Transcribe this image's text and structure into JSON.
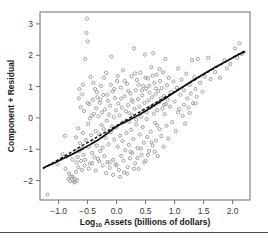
{
  "chart_data": {
    "type": "scatter",
    "title": "",
    "subtitle": "",
    "xlabel": "Log10 Assets (billions of dollars)",
    "xlabel_base": "Log",
    "xlabel_sub": "10",
    "xlabel_rest": " Assets (billions of dollars)",
    "ylabel": "Component + Residual",
    "xlim": [
      -1.32,
      2.3
    ],
    "ylim": [
      -2.62,
      3.38
    ],
    "xticks": [
      -1.0,
      -0.5,
      0.0,
      0.5,
      1.0,
      1.5,
      2.0
    ],
    "xticklabels": [
      "-1.0",
      "-0.5",
      "0.0",
      "0.5",
      "1.0",
      "1.5",
      "2.0"
    ],
    "yticks": [
      -2,
      -1,
      0,
      1,
      2,
      3
    ],
    "yticklabels": [
      "-2",
      "-1",
      "0",
      "1",
      "2",
      "3"
    ],
    "grid": false,
    "legend": "none",
    "marker": "open-circle",
    "marker_color": "#8b8b8b",
    "marker_size": 3.2,
    "frame_color": "#6f6f6f",
    "line_color": "#111111",
    "series": [
      {
        "name": "Component + Residual",
        "points": [
          [
            -1.19,
            -2.45
          ],
          [
            -1.02,
            -1.48
          ],
          [
            -0.93,
            -1.16
          ],
          [
            -0.89,
            -0.57
          ],
          [
            -0.86,
            -1.23
          ],
          [
            -0.83,
            -1.95
          ],
          [
            -0.8,
            -2.02
          ],
          [
            -0.78,
            -1.88
          ],
          [
            -0.76,
            -1.33
          ],
          [
            -0.74,
            -2.03
          ],
          [
            -0.72,
            -1.95
          ],
          [
            -0.71,
            -1.05
          ],
          [
            -0.7,
            -0.62
          ],
          [
            -0.69,
            -1.42
          ],
          [
            -0.68,
            -1.99
          ],
          [
            -0.67,
            -1.25
          ],
          [
            -0.66,
            -0.33
          ],
          [
            -0.65,
            0.62
          ],
          [
            -0.64,
            -1.05
          ],
          [
            -0.63,
            -0.81
          ],
          [
            -0.62,
            0.34
          ],
          [
            -0.61,
            -1.37
          ],
          [
            -0.6,
            -0.98
          ],
          [
            -0.59,
            0.75
          ],
          [
            -0.58,
            -0.48
          ],
          [
            -0.57,
            -1.18
          ],
          [
            -0.56,
            0.22
          ],
          [
            -0.55,
            -1.52
          ],
          [
            -0.54,
            1.88
          ],
          [
            -0.53,
            -0.71
          ],
          [
            -0.52,
            2.71
          ],
          [
            -0.51,
            3.17
          ],
          [
            -0.5,
            2.44
          ],
          [
            -0.49,
            -0.19
          ],
          [
            -0.48,
            -0.92
          ],
          [
            -0.47,
            0.44
          ],
          [
            -0.46,
            -1.46
          ],
          [
            -0.45,
            1.31
          ],
          [
            -0.44,
            -0.55
          ],
          [
            -0.43,
            0.07
          ],
          [
            -0.42,
            -1.12
          ],
          [
            -0.41,
            0.58
          ],
          [
            -0.4,
            -0.77
          ],
          [
            -0.39,
            0.13
          ],
          [
            -0.38,
            -1.26
          ],
          [
            -0.37,
            0.92
          ],
          [
            -0.36,
            -0.42
          ],
          [
            -0.35,
            0.31
          ],
          [
            -0.34,
            -0.88
          ],
          [
            -0.33,
            0.66
          ],
          [
            -0.32,
            -1.31
          ],
          [
            -0.31,
            0.05
          ],
          [
            -0.3,
            -0.52
          ],
          [
            -0.29,
            0.48
          ],
          [
            -0.28,
            -1.06
          ],
          [
            -0.27,
            1.02
          ],
          [
            -0.26,
            -0.23
          ],
          [
            -0.25,
            0.18
          ],
          [
            -0.24,
            -0.95
          ],
          [
            -0.23,
            0.73
          ],
          [
            -0.22,
            -0.36
          ],
          [
            -0.21,
            -1.22
          ],
          [
            -0.2,
            0.27
          ],
          [
            -0.19,
            -0.63
          ],
          [
            -0.18,
            1.44
          ],
          [
            -0.17,
            -0.09
          ],
          [
            -0.16,
            -1.41
          ],
          [
            -0.15,
            0.55
          ],
          [
            -0.14,
            -0.84
          ],
          [
            -0.13,
            0.11
          ],
          [
            -0.12,
            -1.59
          ],
          [
            -0.11,
            0.39
          ],
          [
            -0.1,
            -0.45
          ],
          [
            -0.09,
            1.96
          ],
          [
            -0.08,
            -0.28
          ],
          [
            -0.07,
            0.84
          ],
          [
            -0.06,
            -1.34
          ],
          [
            -0.05,
            0.02
          ],
          [
            -0.04,
            -0.69
          ],
          [
            -0.03,
            0.64
          ],
          [
            -0.02,
            -1.48
          ],
          [
            -0.01,
            0.24
          ],
          [
            0.0,
            -0.31
          ],
          [
            0.01,
            1.18
          ],
          [
            0.02,
            -0.92
          ],
          [
            0.03,
            0.46
          ],
          [
            0.04,
            -1.66
          ],
          [
            0.05,
            0.08
          ],
          [
            0.06,
            -0.57
          ],
          [
            0.07,
            0.97
          ],
          [
            0.08,
            -1.21
          ],
          [
            0.09,
            0.33
          ],
          [
            0.1,
            -0.74
          ],
          [
            0.11,
            1.52
          ],
          [
            0.12,
            -0.14
          ],
          [
            0.13,
            -1.74
          ],
          [
            0.14,
            0.69
          ],
          [
            0.15,
            -1.03
          ],
          [
            0.16,
            0.21
          ],
          [
            0.17,
            -0.48
          ],
          [
            0.18,
            1.09
          ],
          [
            0.19,
            -1.57
          ],
          [
            0.2,
            0.41
          ],
          [
            0.21,
            -0.86
          ],
          [
            0.22,
            0.15
          ],
          [
            0.23,
            -1.29
          ],
          [
            0.24,
            0.78
          ],
          [
            0.25,
            -0.38
          ],
          [
            0.26,
            1.33
          ],
          [
            0.27,
            -1.12
          ],
          [
            0.28,
            0.52
          ],
          [
            0.29,
            -0.67
          ],
          [
            0.3,
            2.22
          ],
          [
            0.31,
            0.29
          ],
          [
            0.32,
            -1.45
          ],
          [
            0.33,
            0.88
          ],
          [
            0.34,
            -0.21
          ],
          [
            0.35,
            1.21
          ],
          [
            0.36,
            -0.96
          ],
          [
            0.37,
            0.6
          ],
          [
            0.38,
            -1.63
          ],
          [
            0.39,
            0.36
          ],
          [
            0.4,
            -0.53
          ],
          [
            0.41,
            1.44
          ],
          [
            0.42,
            0.04
          ],
          [
            0.43,
            -1.18
          ],
          [
            0.44,
            0.72
          ],
          [
            0.45,
            -0.29
          ],
          [
            0.46,
            1.02
          ],
          [
            0.47,
            -0.79
          ],
          [
            0.48,
            0.48
          ],
          [
            0.49,
            2.02
          ],
          [
            0.5,
            -1.36
          ],
          [
            0.51,
            0.93
          ],
          [
            0.52,
            0.18
          ],
          [
            0.53,
            -0.61
          ],
          [
            0.54,
            1.26
          ],
          [
            0.55,
            0.56
          ],
          [
            0.56,
            -1.05
          ],
          [
            0.57,
            0.81
          ],
          [
            0.58,
            0.33
          ],
          [
            0.59,
            -0.44
          ],
          [
            0.6,
            1.62
          ],
          [
            0.61,
            0.66
          ],
          [
            0.62,
            -0.88
          ],
          [
            0.63,
            2.06
          ],
          [
            0.64,
            0.41
          ],
          [
            0.65,
            1.12
          ],
          [
            0.66,
            -0.16
          ],
          [
            0.67,
            0.75
          ],
          [
            0.68,
            -0.72
          ],
          [
            0.69,
            1.38
          ],
          [
            0.7,
            0.25
          ],
          [
            0.71,
            -1.22
          ],
          [
            0.72,
            0.86
          ],
          [
            0.73,
            0.5
          ],
          [
            0.74,
            -0.36
          ],
          [
            0.75,
            1.18
          ],
          [
            0.76,
            0.62
          ],
          [
            0.77,
            -0.58
          ],
          [
            0.78,
            0.95
          ],
          [
            0.79,
            0.3
          ],
          [
            0.8,
            1.46
          ],
          [
            0.81,
            -0.92
          ],
          [
            0.82,
            0.7
          ],
          [
            0.83,
            0.12
          ],
          [
            0.84,
            1.88
          ],
          [
            0.85,
            0.44
          ],
          [
            0.86,
            -0.25
          ],
          [
            0.87,
            1.04
          ],
          [
            0.88,
            0.58
          ],
          [
            0.89,
            -0.66
          ],
          [
            0.9,
            1.28
          ],
          [
            0.92,
            0.36
          ],
          [
            0.94,
            0.82
          ],
          [
            0.96,
            -0.13
          ],
          [
            0.98,
            1.16
          ],
          [
            1.0,
            0.52
          ],
          [
            1.02,
            -0.42
          ],
          [
            1.04,
            0.96
          ],
          [
            1.06,
            1.58
          ],
          [
            1.08,
            0.28
          ],
          [
            1.1,
            0.74
          ],
          [
            1.12,
            1.22
          ],
          [
            1.14,
            0.07
          ],
          [
            1.16,
            0.88
          ],
          [
            1.18,
            -0.18
          ],
          [
            1.2,
            1.41
          ],
          [
            1.22,
            0.62
          ],
          [
            1.24,
            0.33
          ],
          [
            1.26,
            1.05
          ],
          [
            1.28,
            0.78
          ],
          [
            1.3,
            1.84
          ],
          [
            1.32,
            0.47
          ],
          [
            1.34,
            1.3
          ],
          [
            1.36,
            0.92
          ],
          [
            1.38,
            0.68
          ],
          [
            1.4,
            1.88
          ],
          [
            1.44,
            1.12
          ],
          [
            1.48,
            0.84
          ],
          [
            1.52,
            1.32
          ],
          [
            1.58,
            1.92
          ],
          [
            1.62,
            1.24
          ],
          [
            1.7,
            1.46
          ],
          [
            1.78,
            1.28
          ],
          [
            1.86,
            1.84
          ],
          [
            1.9,
            1.58
          ],
          [
            1.96,
            1.72
          ],
          [
            2.04,
            2.22
          ],
          [
            2.08,
            1.92
          ],
          [
            2.12,
            2.38
          ],
          [
            2.16,
            2.04
          ],
          [
            -0.64,
            0.92
          ],
          [
            -0.58,
            1.06
          ],
          [
            -0.5,
            0.48
          ],
          [
            -0.46,
            -0.02
          ],
          [
            -0.4,
            1.12
          ],
          [
            -0.34,
            0.82
          ],
          [
            -0.28,
            0.58
          ],
          [
            -0.22,
            1.28
          ],
          [
            -0.16,
            0.74
          ],
          [
            -0.1,
            1.06
          ],
          [
            -0.04,
            0.92
          ],
          [
            0.02,
            1.34
          ],
          [
            0.08,
            0.62
          ],
          [
            0.14,
            1.18
          ],
          [
            0.2,
            0.86
          ],
          [
            0.26,
            0.58
          ],
          [
            0.32,
            1.42
          ],
          [
            0.38,
            1.06
          ],
          [
            0.44,
            0.88
          ],
          [
            0.5,
            1.28
          ],
          [
            0.56,
            1.02
          ],
          [
            0.62,
            1.34
          ],
          [
            0.68,
            0.94
          ],
          [
            0.74,
            1.56
          ],
          [
            -0.7,
            -1.72
          ],
          [
            -0.66,
            -1.58
          ],
          [
            -0.6,
            -1.66
          ],
          [
            -0.54,
            -1.34
          ],
          [
            -0.48,
            -1.62
          ],
          [
            -0.42,
            -1.44
          ],
          [
            -0.36,
            -1.68
          ],
          [
            -0.3,
            -1.38
          ],
          [
            -0.24,
            -1.52
          ],
          [
            -0.18,
            -1.76
          ],
          [
            -0.12,
            -1.42
          ],
          [
            -0.06,
            -1.82
          ],
          [
            0.0,
            -1.52
          ],
          [
            0.06,
            -1.88
          ],
          [
            0.12,
            -1.36
          ],
          [
            0.18,
            -1.78
          ],
          [
            0.24,
            -1.08
          ],
          [
            0.3,
            -1.62
          ],
          [
            0.36,
            -1.28
          ],
          [
            0.42,
            -0.98
          ],
          [
            0.48,
            -1.42
          ],
          [
            0.54,
            -1.18
          ],
          [
            0.6,
            -0.78
          ],
          [
            0.66,
            -1.08
          ],
          [
            -0.88,
            -1.62
          ],
          [
            -0.82,
            -1.78
          ],
          [
            -0.76,
            -1.88
          ],
          [
            -0.72,
            -2.06
          ],
          [
            0.22,
            -0.12
          ],
          [
            0.28,
            0.08
          ],
          [
            0.34,
            -0.06
          ],
          [
            0.46,
            0.24
          ],
          [
            0.52,
            -0.04
          ],
          [
            0.64,
            0.14
          ],
          [
            0.7,
            -0.24
          ],
          [
            0.82,
            0.42
          ],
          [
            1.06,
            0.18
          ],
          [
            1.16,
            0.42
          ],
          [
            1.26,
            0.16
          ],
          [
            1.36,
            0.46
          ]
        ]
      }
    ],
    "fit_lines": [
      {
        "name": "loess-smooth",
        "style": "solid",
        "color": "#111111",
        "points": [
          [
            -1.27,
            -1.6
          ],
          [
            -1.1,
            -1.46
          ],
          [
            -0.9,
            -1.28
          ],
          [
            -0.7,
            -1.1
          ],
          [
            -0.5,
            -0.9
          ],
          [
            -0.3,
            -0.68
          ],
          [
            -0.15,
            -0.48
          ],
          [
            -0.05,
            -0.34
          ],
          [
            0.05,
            -0.22
          ],
          [
            0.2,
            -0.08
          ],
          [
            0.35,
            0.06
          ],
          [
            0.5,
            0.22
          ],
          [
            0.7,
            0.46
          ],
          [
            0.9,
            0.7
          ],
          [
            1.1,
            0.94
          ],
          [
            1.3,
            1.18
          ],
          [
            1.5,
            1.4
          ],
          [
            1.7,
            1.62
          ],
          [
            1.9,
            1.82
          ],
          [
            2.1,
            2.02
          ],
          [
            2.22,
            2.12
          ]
        ]
      },
      {
        "name": "linear-fit",
        "style": "dashed",
        "color": "#111111",
        "points": [
          [
            -1.27,
            -1.62
          ],
          [
            2.22,
            2.16
          ]
        ]
      }
    ]
  }
}
